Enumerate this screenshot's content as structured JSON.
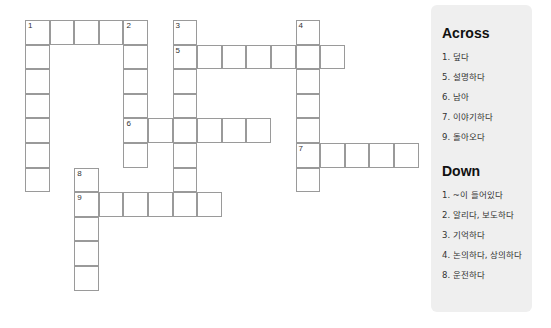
{
  "puzzle": {
    "origin": {
      "x": 25,
      "y": 20
    },
    "cell_size": 24.6,
    "words": [
      {
        "number": "1",
        "direction": "across",
        "row": 0,
        "col": 0,
        "length": 5
      },
      {
        "number": "1",
        "direction": "down",
        "row": 0,
        "col": 0,
        "length": 7
      },
      {
        "number": "2",
        "direction": "down",
        "row": 0,
        "col": 4,
        "length": 6
      },
      {
        "number": "3",
        "direction": "down",
        "row": 0,
        "col": 6,
        "length": 8
      },
      {
        "number": "4",
        "direction": "down",
        "row": 0,
        "col": 11,
        "length": 7
      },
      {
        "number": "5",
        "direction": "across",
        "row": 1,
        "col": 6,
        "length": 7
      },
      {
        "number": "6",
        "direction": "across",
        "row": 4,
        "col": 4,
        "length": 6
      },
      {
        "number": "7",
        "direction": "across",
        "row": 5,
        "col": 11,
        "length": 5
      },
      {
        "number": "8",
        "direction": "down",
        "row": 6,
        "col": 2,
        "length": 5
      },
      {
        "number": "9",
        "direction": "across",
        "row": 7,
        "col": 2,
        "length": 6
      }
    ]
  },
  "clues": {
    "across_title": "Across",
    "across": [
      {
        "label": "1.",
        "text": "덮다"
      },
      {
        "label": "5.",
        "text": "설명하다"
      },
      {
        "label": "6.",
        "text": "남아"
      },
      {
        "label": "7.",
        "text": "이야기하다"
      },
      {
        "label": "9.",
        "text": "돌아오다"
      }
    ],
    "down_title": "Down",
    "down": [
      {
        "label": "1.",
        "text": "~이 들어있다"
      },
      {
        "label": "2.",
        "text": "알리다, 보도하다"
      },
      {
        "label": "3.",
        "text": "기억하다"
      },
      {
        "label": "4.",
        "text": "논의하다, 상의하다"
      },
      {
        "label": "8.",
        "text": "운전하다"
      }
    ]
  }
}
